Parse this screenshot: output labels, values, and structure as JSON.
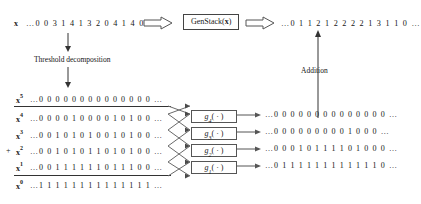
{
  "figure": {
    "top_row": {
      "input_var": "x",
      "input_superscript": "",
      "input_sequence": "…0 0 3 1 4 1 3 2 0 4 1 4 0 0 …",
      "process_box_label_prefix": "GenStack(",
      "process_box_label_var": "x",
      "process_box_label_suffix": ")",
      "output_sequence": "…0 1 1 2 1 2 2 2 2 1 3 1 1 0 …"
    },
    "captions": {
      "threshold": "Threshold decomposition",
      "addition": "Addition"
    },
    "plus_sign": "+",
    "decomposition_rows": [
      {
        "var": "x",
        "superscript": "5",
        "sequence": "…0 0 0 0 0 0 0 0 0 0 0 0 0 0 …",
        "has_gbox": false,
        "gbox_label": "",
        "gbox_sub": "",
        "output": ""
      },
      {
        "var": "x",
        "superscript": "4",
        "sequence": "…0 0 0 0 1 0 0 0 0 1 0 1 0 0 …",
        "has_gbox": true,
        "gbox_label": "g",
        "gbox_sub": "4",
        "output": "…0 0 0 0 0 0 0 0 0 0 0 0 0 0 …"
      },
      {
        "var": "x",
        "superscript": "3",
        "sequence": "…0 0 1 0 1 0 1 0 0 1 0 1 0 0 …",
        "has_gbox": true,
        "gbox_label": "g",
        "gbox_sub": "3",
        "output": "…0 0 0 0 0 0 0 0 0 1 0 0 0 …"
      },
      {
        "var": "x",
        "superscript": "2",
        "sequence": "…0 0 1 0 1 0 1 1 0 1 0 1 0 0 …",
        "has_gbox": true,
        "gbox_label": "g",
        "gbox_sub": "2",
        "output": "…0 0 0 1 0 1 1 1 1 0 1 0 0 0 …"
      },
      {
        "var": "x",
        "superscript": "1",
        "sequence": "…0 0 1 1 1 1 1 1 0 1 1 1 0 0 …",
        "has_gbox": true,
        "gbox_label": "g",
        "gbox_sub": "1",
        "output": "…0 1 1 1 1 1 1 1 1 1 1 1 1 0 …"
      },
      {
        "var": "x",
        "superscript": "0",
        "sequence": "…1 1 1 1 1 1 1 1 1 1 1 1 1 1 …",
        "has_gbox": false,
        "gbox_label": "",
        "gbox_sub": "",
        "output": ""
      }
    ],
    "gbox_paren": "( · )",
    "colors": {
      "ink": "#1a1a1a",
      "rule": "#333333",
      "arrow_outline": "#555555",
      "background": "#ffffff"
    }
  }
}
